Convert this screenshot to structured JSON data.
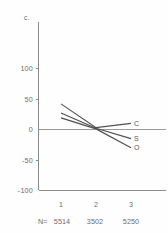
{
  "chart_data": {
    "type": "line",
    "title": "",
    "corner_label": "c.",
    "xlabel": "",
    "ylabel": "",
    "categories": [
      "1",
      "2",
      "3"
    ],
    "x": [
      1,
      2,
      3
    ],
    "ylim": [
      -100,
      130
    ],
    "yticks": [
      100,
      50,
      0,
      -50,
      -100
    ],
    "ytick_labels": [
      "100",
      "50",
      "0",
      "-50",
      "-100"
    ],
    "xtick_labels": [
      "1",
      "2",
      "3"
    ],
    "grid": false,
    "legend_position": "right-endpoint-labels",
    "series": [
      {
        "name": "C",
        "label": "C",
        "values": [
          42,
          3,
          10
        ]
      },
      {
        "name": "S",
        "label": "S",
        "values": [
          27,
          2,
          -15
        ]
      },
      {
        "name": "O",
        "label": "O",
        "values": [
          19,
          1,
          -30
        ]
      }
    ],
    "annotations": {
      "n_prefix": "N=",
      "n_values": [
        "5514",
        "3502",
        "5250"
      ],
      "n_row_text": "N=5514 3502 5250"
    }
  },
  "axis": {
    "y_axis_name": "y-axis",
    "x_axis_name": "x-axis",
    "zero_line_name": "zero-reference-line",
    "baseline_name": "bottom-baseline"
  }
}
